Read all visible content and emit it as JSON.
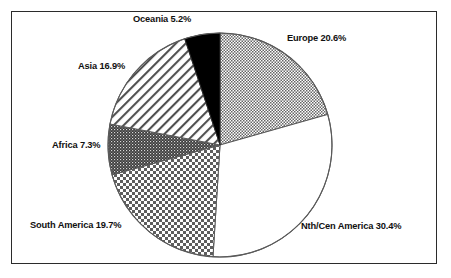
{
  "figure": {
    "background_color": "#ffffff",
    "frame_color": "#2b2b2b",
    "outline_color": "#555555"
  },
  "chart_data": {
    "type": "pie",
    "title": "",
    "subtitle": "",
    "xlabel": "",
    "ylabel": "",
    "legend_position": "none",
    "grid": false,
    "labels_outside": true,
    "start_angle_deg": 0,
    "direction": "clockwise",
    "units": "percent",
    "categories": [
      "Europe",
      "Nth/Cen America",
      "South America",
      "Africa",
      "Asia",
      "Oceania"
    ],
    "values": [
      20.6,
      30.4,
      19.7,
      7.3,
      16.9,
      5.2
    ],
    "slices": [
      {
        "name": "Europe",
        "value": 20.6,
        "label": "Europe 20.6%",
        "fill": "fine-checker",
        "fill_tone": "#a8a8a8",
        "start_pct": 0.0,
        "end_pct": 20.6
      },
      {
        "name": "Nth/Cen America",
        "value": 30.4,
        "label": "Nth/Cen America 30.4%",
        "fill": "solid-white",
        "fill_tone": "#ffffff",
        "start_pct": 20.6,
        "end_pct": 51.0
      },
      {
        "name": "South America",
        "value": 19.7,
        "label": "South America 19.7%",
        "fill": "coarse-checker",
        "fill_tone": "#9a9a9a",
        "start_pct": 51.0,
        "end_pct": 70.7
      },
      {
        "name": "Africa",
        "value": 7.3,
        "label": "Africa 7.3%",
        "fill": "dense-dither",
        "fill_tone": "#4a4a4a",
        "start_pct": 70.7,
        "end_pct": 78.0
      },
      {
        "name": "Asia",
        "value": 16.9,
        "label": "Asia 16.9%",
        "fill": "diagonal-hatch",
        "fill_tone": "#cfcfcf",
        "start_pct": 78.0,
        "end_pct": 94.9
      },
      {
        "name": "Oceania",
        "value": 5.2,
        "label": "Oceania 5.2%",
        "fill": "solid-black",
        "fill_tone": "#000000",
        "start_pct": 94.9,
        "end_pct": 100.0
      }
    ],
    "total": 100.1
  },
  "labels": {
    "oceania": "Oceania 5.2%",
    "europe": "Europe 20.6%",
    "asia": "Asia 16.9%",
    "africa": "Africa 7.3%",
    "south_america": "South America 19.7%",
    "nth_cen_america": "Nth/Cen America 30.4%"
  }
}
